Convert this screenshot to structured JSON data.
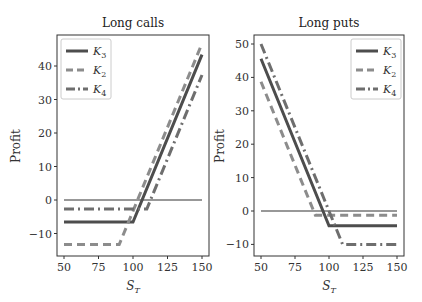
{
  "chart_data": [
    {
      "type": "line",
      "title": "Long calls",
      "xlabel": "S_T",
      "ylabel": "Profit",
      "xlim": [
        45,
        155
      ],
      "ylim": [
        -16,
        48
      ],
      "xticks": [
        50,
        75,
        100,
        125,
        150
      ],
      "yticks": [
        -10,
        0,
        10,
        20,
        30,
        40
      ],
      "grid": false,
      "legend_position": "upper left",
      "series": [
        {
          "name": "K3",
          "style": "solid",
          "x": [
            50,
            100,
            150
          ],
          "y": [
            -6.6,
            -6.6,
            43.4
          ]
        },
        {
          "name": "K2",
          "style": "dashed",
          "x": [
            50,
            90,
            150
          ],
          "y": [
            -13.3,
            -13.3,
            46.7
          ]
        },
        {
          "name": "K4",
          "style": "dashdot",
          "x": [
            50,
            110,
            150
          ],
          "y": [
            -2.7,
            -2.7,
            37.3
          ]
        }
      ],
      "reference_line": {
        "y": 0,
        "x": [
          50,
          150
        ]
      }
    },
    {
      "type": "line",
      "title": "Long puts",
      "xlabel": "S_T",
      "ylabel": "Profit",
      "xlim": [
        45,
        155
      ],
      "ylim": [
        -13,
        52
      ],
      "xticks": [
        50,
        75,
        100,
        125,
        150
      ],
      "yticks": [
        -10,
        0,
        10,
        20,
        30,
        40,
        50
      ],
      "grid": false,
      "legend_position": "upper right",
      "series": [
        {
          "name": "K3",
          "style": "solid",
          "x": [
            50,
            100,
            150
          ],
          "y": [
            45.6,
            -4.4,
            -4.4
          ]
        },
        {
          "name": "K2",
          "style": "dashed",
          "x": [
            50,
            90,
            150
          ],
          "y": [
            38.7,
            -1.3,
            -1.3
          ]
        },
        {
          "name": "K4",
          "style": "dashdot",
          "x": [
            50,
            110,
            150
          ],
          "y": [
            50,
            -10,
            -10
          ]
        }
      ],
      "reference_line": {
        "y": 0,
        "x": [
          50,
          150
        ]
      }
    }
  ],
  "labels": {
    "left_title": "Long calls",
    "right_title": "Long puts",
    "ylabel": "Profit",
    "xlabel_main": "S",
    "xlabel_sub": "T",
    "legend": [
      {
        "main": "K",
        "sub": "3"
      },
      {
        "main": "K",
        "sub": "2"
      },
      {
        "main": "K",
        "sub": "4"
      }
    ],
    "left_yticks": [
      "40",
      "30",
      "20",
      "10",
      "0",
      "−10"
    ],
    "right_yticks": [
      "50",
      "40",
      "30",
      "20",
      "10",
      "0",
      "−10"
    ],
    "xticks": [
      "50",
      "75",
      "100",
      "125",
      "150"
    ]
  },
  "colors": {
    "k3": "#4d4d4d",
    "k2": "#8c8c8c",
    "k4": "#6e6e6e",
    "zero": "#333333",
    "axes": "#333333"
  }
}
